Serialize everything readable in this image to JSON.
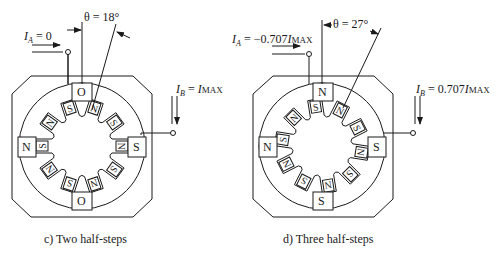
{
  "panels": [
    {
      "id": "c",
      "caption": "c)  Two half-steps",
      "theta_label": "θ = 18°",
      "theta_deg": 18,
      "ia_label": {
        "sym": "I",
        "sub": "A",
        "rest": " = 0"
      },
      "ib_label": {
        "sym": "I",
        "sub": "B",
        "rest": " = ",
        "rhs_sym": "I",
        "rhs_sub": "MAX"
      },
      "stator_poles": {
        "top": "O",
        "left": "N",
        "right": "S",
        "bottom": "O"
      },
      "rotor_teeth": [
        "N",
        "S",
        "N",
        "S",
        "N",
        "S",
        "N",
        "S",
        "N",
        "S"
      ]
    },
    {
      "id": "d",
      "caption": "d)  Three half-steps",
      "theta_label": "θ = 27°",
      "theta_deg": 27,
      "ia_label": {
        "sym": "I",
        "sub": "A",
        "rest": " = −0.707",
        "rhs_sym": "I",
        "rhs_sub": "MAX"
      },
      "ib_label": {
        "sym": "I",
        "sub": "B",
        "rest": " = 0.707",
        "rhs_sym": "I",
        "rhs_sub": "MAX"
      },
      "stator_poles": {
        "top": "N",
        "left": "N",
        "right": "S",
        "bottom": "S"
      },
      "rotor_teeth": [
        "N",
        "S",
        "N",
        "S",
        "N",
        "S",
        "N",
        "S",
        "N",
        "S"
      ]
    }
  ]
}
